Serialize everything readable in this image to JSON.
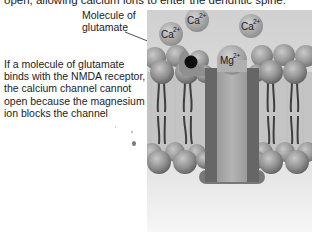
{
  "top_caption": "open, allowing calcium ions to enter the dendritic spine.",
  "side_caption": "If a molecule of glutamate binds with the NMDA receptor, the calcium channel cannot open because the magnesium ion blocks the channel",
  "labels": {
    "glutamate": "Molecule of glutamate",
    "receptor": "NMDA receptor"
  },
  "ions": [
    {
      "symbol": "Ca",
      "charge": "2+",
      "kind": "calcium"
    },
    {
      "symbol": "Ca",
      "charge": "2+",
      "kind": "calcium"
    },
    {
      "symbol": "Ca",
      "charge": "2+",
      "kind": "calcium"
    },
    {
      "symbol": "Mg",
      "charge": "2+",
      "kind": "magnesium"
    }
  ],
  "colors": {
    "background_panel": "#d6d6d6",
    "channel_outer": "#6f6f6f",
    "channel_inner": "#a8a8a8",
    "phospholipid_head": "#8c8c8c",
    "glutamate": "#111111",
    "ion": "#a5a5a5"
  }
}
